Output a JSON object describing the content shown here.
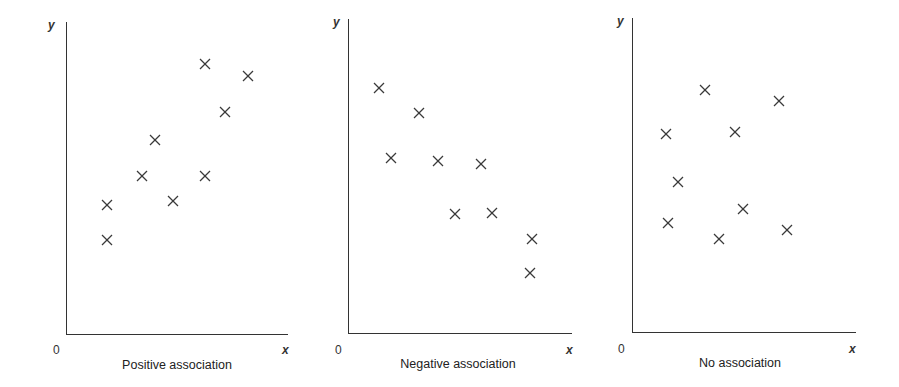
{
  "chart_data": [
    {
      "type": "scatter",
      "title": "Positive association",
      "xlabel": "x",
      "ylabel": "y",
      "origin_label": "0",
      "xlim": [
        0,
        10
      ],
      "ylim": [
        0,
        10
      ],
      "grid": false,
      "marker": "x",
      "points": [
        {
          "x": 1.85,
          "y": 4.13
        },
        {
          "x": 1.85,
          "y": 3.01
        },
        {
          "x": 3.42,
          "y": 5.06
        },
        {
          "x": 4.01,
          "y": 6.22
        },
        {
          "x": 4.82,
          "y": 4.26
        },
        {
          "x": 6.26,
          "y": 8.65
        },
        {
          "x": 6.26,
          "y": 5.06
        },
        {
          "x": 7.16,
          "y": 7.12
        },
        {
          "x": 8.2,
          "y": 8.27
        }
      ]
    },
    {
      "type": "scatter",
      "title": "Negative association",
      "xlabel": "x",
      "ylabel": "y",
      "origin_label": "0",
      "xlim": [
        0,
        10
      ],
      "ylim": [
        0,
        10
      ],
      "grid": false,
      "marker": "x",
      "points": [
        {
          "x": 1.38,
          "y": 7.8
        },
        {
          "x": 1.92,
          "y": 5.57
        },
        {
          "x": 3.17,
          "y": 7.01
        },
        {
          "x": 4.02,
          "y": 5.48
        },
        {
          "x": 4.78,
          "y": 3.79
        },
        {
          "x": 5.94,
          "y": 5.38
        },
        {
          "x": 6.43,
          "y": 3.82
        },
        {
          "x": 8.21,
          "y": 2.99
        },
        {
          "x": 8.13,
          "y": 1.91
        }
      ]
    },
    {
      "type": "scatter",
      "title": "No association",
      "xlabel": "x",
      "ylabel": "y",
      "origin_label": "0",
      "xlim": [
        0,
        10
      ],
      "ylim": [
        0,
        10
      ],
      "grid": false,
      "marker": "x",
      "points": [
        {
          "x": 1.52,
          "y": 6.31
        },
        {
          "x": 1.61,
          "y": 3.47
        },
        {
          "x": 2.05,
          "y": 4.78
        },
        {
          "x": 3.26,
          "y": 7.71
        },
        {
          "x": 3.88,
          "y": 2.96
        },
        {
          "x": 4.6,
          "y": 6.37
        },
        {
          "x": 4.96,
          "y": 3.92
        },
        {
          "x": 6.56,
          "y": 7.36
        },
        {
          "x": 6.92,
          "y": 3.25
        }
      ]
    }
  ],
  "colors": {
    "axis": "#333333",
    "marker": "#3a3a3a",
    "text": "#222222",
    "background": "#ffffff"
  },
  "layout": {
    "panels": [
      {
        "left": 66,
        "top": 22,
        "width": 222,
        "height": 312
      },
      {
        "left": 348,
        "top": 19,
        "width": 224,
        "height": 314
      },
      {
        "left": 632,
        "top": 18,
        "width": 224,
        "height": 314
      }
    ]
  }
}
